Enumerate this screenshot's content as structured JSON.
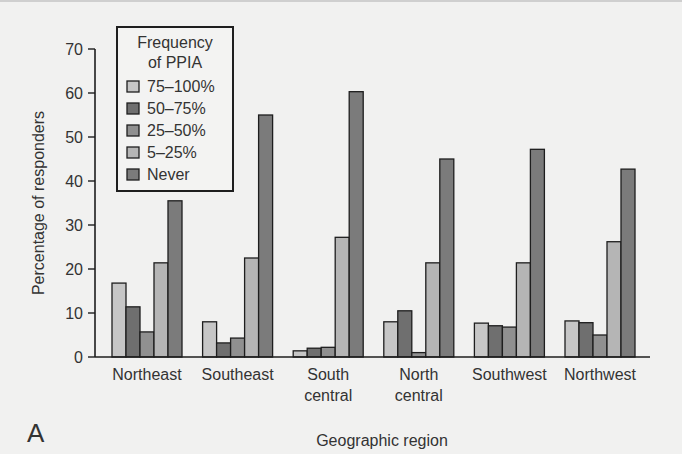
{
  "chart_data": {
    "type": "bar",
    "title": "",
    "panel_label": "A",
    "xlabel": "Geographic region",
    "ylabel": "Percentage of responders",
    "ylim": [
      0,
      70
    ],
    "yticks": [
      0,
      10,
      20,
      30,
      40,
      50,
      60,
      70
    ],
    "grid": false,
    "legend_position": "upper-left-inside",
    "legend_title": [
      "Frequency",
      "of PPIA"
    ],
    "categories": [
      [
        "Northeast"
      ],
      [
        "Southeast"
      ],
      [
        "South",
        "central"
      ],
      [
        "North",
        "central"
      ],
      [
        "Southwest"
      ],
      [
        "Northwest"
      ]
    ],
    "series": [
      {
        "name": "75–100%",
        "color": "#c6c6c6",
        "values": [
          16.8,
          8.0,
          1.4,
          8.0,
          7.7,
          8.2
        ]
      },
      {
        "name": "50–75%",
        "color": "#6f6f6f",
        "values": [
          11.4,
          3.2,
          2.0,
          10.5,
          7.1,
          7.8
        ]
      },
      {
        "name": "25–50%",
        "color": "#909090",
        "values": [
          5.7,
          4.3,
          2.2,
          1.0,
          6.8,
          5.0
        ]
      },
      {
        "name": "5–25%",
        "color": "#b5b5b5",
        "values": [
          21.4,
          22.5,
          27.2,
          21.4,
          21.4,
          26.2
        ]
      },
      {
        "name": "Never",
        "color": "#7b7b7b",
        "values": [
          35.5,
          55.0,
          60.3,
          45.0,
          47.2,
          42.7
        ]
      }
    ]
  }
}
